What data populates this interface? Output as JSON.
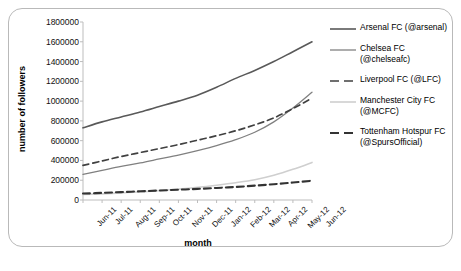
{
  "chart_data": {
    "type": "line",
    "title": "",
    "xlabel": "month",
    "ylabel": "number of followers",
    "grid": false,
    "legend_position": "right",
    "ylim": [
      0,
      1800000
    ],
    "yticks": [
      0,
      200000,
      400000,
      600000,
      800000,
      1000000,
      1200000,
      1400000,
      1600000,
      1800000
    ],
    "ytick_labels": [
      "0",
      "200000",
      "400000",
      "600000",
      "800000",
      "1000000",
      "1200000",
      "1400000",
      "1600000",
      "1800000"
    ],
    "categories": [
      "Jun-11",
      "Jul-11",
      "Aug-11",
      "Sep-11",
      "Oct-11",
      "Nov-11",
      "Dec-11",
      "Jan-12",
      "Feb-12",
      "Mar-12",
      "Apr-12",
      "May-12",
      "Jun-12"
    ],
    "series": [
      {
        "name": "Arsenal FC (@arsenal)",
        "color": "#595959",
        "style": "solid",
        "width": 1.6,
        "values": [
          730000,
          790000,
          840000,
          890000,
          945000,
          1000000,
          1060000,
          1140000,
          1230000,
          1310000,
          1400000,
          1500000,
          1600000
        ]
      },
      {
        "name": "Chelsea FC (@chelseafc)",
        "color": "#808080",
        "style": "solid",
        "width": 1.3,
        "values": [
          260000,
          300000,
          340000,
          375000,
          415000,
          455000,
          500000,
          550000,
          610000,
          685000,
          790000,
          930000,
          1090000
        ]
      },
      {
        "name": "Liverpool FC (@LFC)",
        "color": "#404040",
        "style": "dashed",
        "width": 1.7,
        "values": [
          350000,
          395000,
          440000,
          480000,
          520000,
          560000,
          605000,
          650000,
          700000,
          760000,
          830000,
          925000,
          1030000
        ]
      },
      {
        "name": "Manchester City FC (@MCFC)",
        "color": "#cfcfcf",
        "style": "solid",
        "width": 1.6,
        "values": [
          55000,
          62000,
          72000,
          82000,
          95000,
          110000,
          128000,
          150000,
          175000,
          205000,
          250000,
          310000,
          380000
        ]
      },
      {
        "name": "Tottenham Hotspur FC (@SpursOfficial)",
        "color": "#333333",
        "style": "dashed",
        "width": 2.1,
        "values": [
          65000,
          72000,
          80000,
          88000,
          96000,
          104000,
          112000,
          122000,
          132000,
          145000,
          160000,
          177000,
          195000
        ]
      }
    ]
  }
}
